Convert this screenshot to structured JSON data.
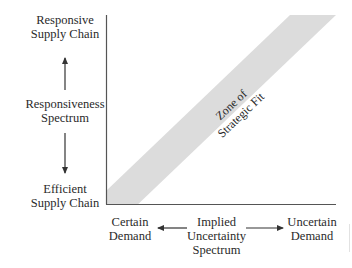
{
  "y_axis": {
    "top_label": [
      "Responsive",
      "Supply Chain"
    ],
    "middle_label": [
      "Responsiveness",
      "Spectrum"
    ],
    "bottom_label": [
      "Efficient",
      "Supply Chain"
    ]
  },
  "x_axis": {
    "left_label": [
      "Certain",
      "Demand"
    ],
    "middle_label": [
      "Implied",
      "Uncertainty",
      "Spectrum"
    ],
    "right_label": [
      "Uncertain",
      "Demand"
    ]
  },
  "zone": {
    "label": [
      "Zone of",
      "Strategic Fit"
    ]
  },
  "colors": {
    "band": "#dcdcdc",
    "axis": "#555555",
    "text": "#2a2a2a"
  }
}
